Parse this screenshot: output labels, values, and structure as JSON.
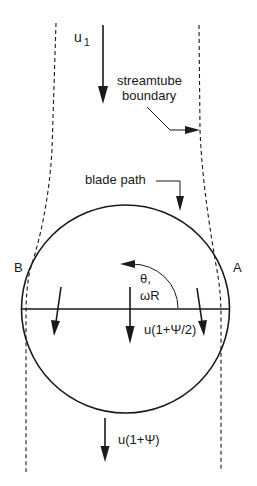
{
  "diagram": {
    "labels": {
      "inflow_velocity": "u",
      "inflow_velocity_subscript": "1",
      "streamtube_line1": "streamtube",
      "streamtube_line2": "boundary",
      "blade_path": "blade path",
      "point_left": "B",
      "point_right": "A",
      "rotation_theta": "θ,",
      "rotation_omega": "ωR",
      "disk_velocity": "u(1+Ψ/2)",
      "wake_velocity": "u(1+Ψ)"
    },
    "colors": {
      "ink": "#1a1a1a",
      "background": "#ffffff"
    }
  }
}
